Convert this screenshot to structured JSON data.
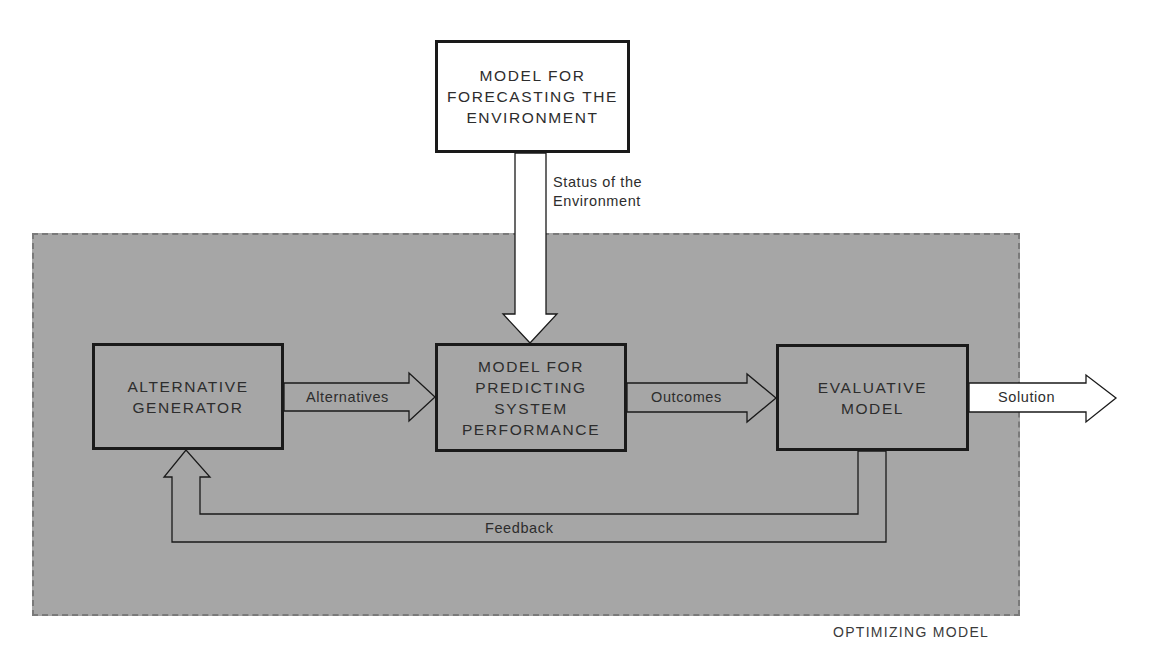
{
  "diagram": {
    "region": {
      "label": "OPTIMIZING MODEL",
      "fill": "#a6a6a6",
      "border": "#7a7a7a"
    },
    "nodes": {
      "forecast": {
        "label": "MODEL FOR\nFORECASTING THE\nENVIRONMENT",
        "fill": "#ffffff"
      },
      "generator": {
        "label": "ALTERNATIVE\nGENERATOR",
        "fill": "#a6a6a6"
      },
      "predictor": {
        "label": "MODEL FOR\nPREDICTING\nSYSTEM\nPERFORMANCE",
        "fill": "#a6a6a6"
      },
      "evaluator": {
        "label": "EVALUATIVE\nMODEL",
        "fill": "#a6a6a6"
      }
    },
    "edges": {
      "status": {
        "from": "forecast",
        "to": "predictor",
        "label": "Status of the\nEnvironment"
      },
      "alternatives": {
        "from": "generator",
        "to": "predictor",
        "label": "Alternatives"
      },
      "outcomes": {
        "from": "predictor",
        "to": "evaluator",
        "label": "Outcomes"
      },
      "solution": {
        "from": "evaluator",
        "to": "output",
        "label": "Solution"
      },
      "feedback": {
        "from": "evaluator",
        "to": "generator",
        "label": "Feedback"
      }
    }
  }
}
